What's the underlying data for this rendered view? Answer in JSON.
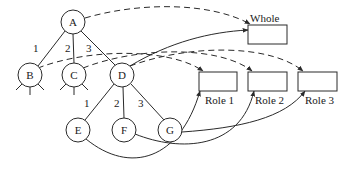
{
  "diagram": {
    "nodes": [
      {
        "id": "A",
        "label": "A",
        "cx": 73,
        "cy": 22
      },
      {
        "id": "B",
        "label": "B",
        "cx": 30,
        "cy": 75
      },
      {
        "id": "C",
        "label": "C",
        "cx": 74,
        "cy": 75
      },
      {
        "id": "D",
        "label": "D",
        "cx": 122,
        "cy": 75
      },
      {
        "id": "E",
        "label": "E",
        "cx": 78,
        "cy": 130
      },
      {
        "id": "F",
        "label": "F",
        "cx": 124,
        "cy": 130
      },
      {
        "id": "G",
        "label": "G",
        "cx": 170,
        "cy": 130
      }
    ],
    "edge_labels": {
      "a_b": "1",
      "a_c": "2",
      "a_d": "3",
      "d_e": "1",
      "d_f": "2",
      "d_g": "3"
    },
    "boxes": {
      "whole": "Whole",
      "role1": "Role 1",
      "role2": "Role 2",
      "role3": "Role 3"
    },
    "colors": {
      "stroke": "#2a2a2a",
      "background": "#ffffff"
    }
  }
}
